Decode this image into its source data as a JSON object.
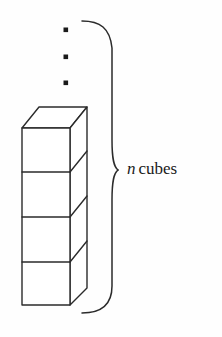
{
  "figure": {
    "name": "stack-of-n-cubes",
    "background_color": "#fefefe",
    "ink_color": "#2b2b2b",
    "label": {
      "variable": "n",
      "word": "cubes",
      "full_text": "n cubes"
    },
    "ellipsis": {
      "name": "vertical-ellipsis",
      "dot_count": 3,
      "meaning": "continuation of cube stack upward"
    },
    "brace": {
      "name": "right-curly-brace",
      "orientation": "vertical",
      "spans": "entire stack including ellipsis",
      "top_y": 21,
      "bottom_y": 313,
      "tip_y": 170
    },
    "cubes": {
      "visible_count": 4,
      "front_face_left_x": 22,
      "front_face_right_x": 70,
      "front_top_y": 128,
      "front_bottom_y": 305,
      "divider_y": [
        172,
        217,
        262
      ],
      "depth_offset_x": 17,
      "depth_offset_y": -21
    }
  }
}
